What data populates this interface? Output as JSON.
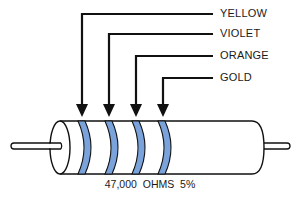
{
  "diagram": {
    "type": "resistor-color-code",
    "band_fill_color": "#7BA3DB",
    "line_color": "#111111",
    "bands": [
      {
        "label": "YELLOW",
        "meaning": "first digit 4"
      },
      {
        "label": "VIOLET",
        "meaning": "second digit 7"
      },
      {
        "label": "ORANGE",
        "meaning": "multiplier x1000"
      },
      {
        "label": "GOLD",
        "meaning": "tolerance 5%"
      }
    ],
    "caption": "47,000  OHMS  5%"
  }
}
